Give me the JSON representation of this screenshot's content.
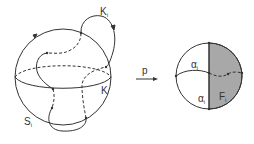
{
  "figure": {
    "left": {
      "knot_label": "K",
      "knot_label_sub": "i",
      "equator_label": "K",
      "sphere_label": "S",
      "sphere_label_sub": "i"
    },
    "map_label": "p",
    "right": {
      "arc_top_label": "α",
      "arc_top_sub": "i",
      "arc_bottom_label": "α",
      "arc_bottom_sub": "i",
      "face_label": "F",
      "face_sub": "i",
      "shade_color": "#a8a8a8"
    }
  }
}
